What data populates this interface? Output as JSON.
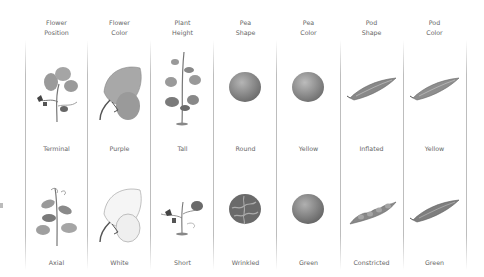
{
  "figure": {
    "columns": [
      {
        "header": [
          "Flower",
          "Position"
        ],
        "row1": {
          "label": "Terminal",
          "icon": "flowering-plant-terminal"
        },
        "row2": {
          "label": "Axial",
          "icon": "flowering-plant-axial"
        }
      },
      {
        "header": [
          "Flower",
          "Color"
        ],
        "row1": {
          "label": "Purple",
          "icon": "flower-purple"
        },
        "row2": {
          "label": "White",
          "icon": "flower-white"
        }
      },
      {
        "header": [
          "Plant",
          "Height"
        ],
        "row1": {
          "label": "Tall",
          "icon": "plant-tall"
        },
        "row2": {
          "label": "Short",
          "icon": "plant-short"
        }
      },
      {
        "header": [
          "Pea",
          "Shape"
        ],
        "row1": {
          "label": "Round",
          "icon": "pea-round"
        },
        "row2": {
          "label": "Wrinkled",
          "icon": "pea-wrinkled"
        }
      },
      {
        "header": [
          "Pea",
          "Color"
        ],
        "row1": {
          "label": "Yellow",
          "icon": "pea-yellow"
        },
        "row2": {
          "label": "Green",
          "icon": "pea-green"
        }
      },
      {
        "header": [
          "Pod",
          "Shape"
        ],
        "row1": {
          "label": "Inflated",
          "icon": "pod-inflated"
        },
        "row2": {
          "label": "Constricted",
          "icon": "pod-constricted"
        }
      },
      {
        "header": [
          "Pod",
          "Color"
        ],
        "row1": {
          "label": "Yellow",
          "icon": "pod-yellow"
        },
        "row2": {
          "label": "Green",
          "icon": "pod-green"
        }
      }
    ],
    "colors": {
      "divider": "#bdbdbd",
      "text": "#666666",
      "illustration_dark": "#6e6e6e",
      "illustration_mid": "#9a9a9a",
      "illustration_light": "#c8c8c8"
    }
  }
}
